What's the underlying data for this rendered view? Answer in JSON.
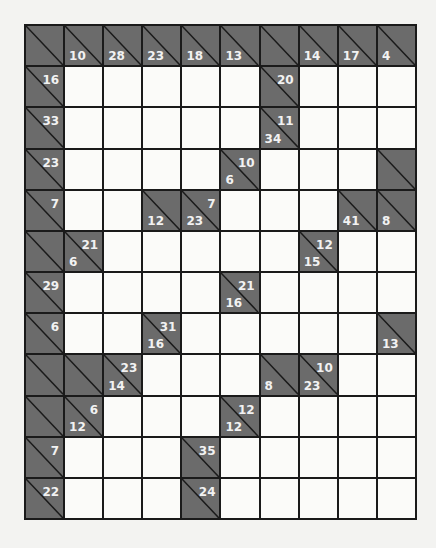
{
  "puzzle": {
    "type": "kakuro",
    "rows": 12,
    "cols": 10,
    "colors": {
      "clue_cell": "#6b6b6b",
      "white_cell": "#fbfbf9",
      "grid_line": "#1a1a1a",
      "clue_text": "#f2f2f2",
      "page_bg": "#f3f3f1"
    },
    "grid": [
      [
        {
          "t": "c"
        },
        {
          "t": "c",
          "d": "10"
        },
        {
          "t": "c",
          "d": "28"
        },
        {
          "t": "c",
          "d": "23"
        },
        {
          "t": "c",
          "d": "18"
        },
        {
          "t": "c",
          "d": "13"
        },
        {
          "t": "c"
        },
        {
          "t": "c",
          "d": "14"
        },
        {
          "t": "c",
          "d": "17"
        },
        {
          "t": "c",
          "d": "4"
        }
      ],
      [
        {
          "t": "c",
          "a": "16"
        },
        {
          "t": "w"
        },
        {
          "t": "w"
        },
        {
          "t": "w"
        },
        {
          "t": "w"
        },
        {
          "t": "w"
        },
        {
          "t": "c",
          "a": "20"
        },
        {
          "t": "w"
        },
        {
          "t": "w"
        },
        {
          "t": "w"
        }
      ],
      [
        {
          "t": "c",
          "a": "33"
        },
        {
          "t": "w"
        },
        {
          "t": "w"
        },
        {
          "t": "w"
        },
        {
          "t": "w"
        },
        {
          "t": "w"
        },
        {
          "t": "c",
          "a": "11",
          "d": "34"
        },
        {
          "t": "w"
        },
        {
          "t": "w"
        },
        {
          "t": "w"
        }
      ],
      [
        {
          "t": "c",
          "a": "23"
        },
        {
          "t": "w"
        },
        {
          "t": "w"
        },
        {
          "t": "w"
        },
        {
          "t": "w"
        },
        {
          "t": "c",
          "a": "10",
          "d": "6"
        },
        {
          "t": "w"
        },
        {
          "t": "w"
        },
        {
          "t": "w"
        },
        {
          "t": "c"
        }
      ],
      [
        {
          "t": "c",
          "a": "7"
        },
        {
          "t": "w"
        },
        {
          "t": "w"
        },
        {
          "t": "c",
          "d": "12"
        },
        {
          "t": "c",
          "a": "7",
          "d": "23"
        },
        {
          "t": "w"
        },
        {
          "t": "w"
        },
        {
          "t": "w"
        },
        {
          "t": "c",
          "d": "41"
        },
        {
          "t": "c",
          "d": "8"
        }
      ],
      [
        {
          "t": "c"
        },
        {
          "t": "c",
          "a": "21",
          "d": "6"
        },
        {
          "t": "w"
        },
        {
          "t": "w"
        },
        {
          "t": "w"
        },
        {
          "t": "w"
        },
        {
          "t": "w"
        },
        {
          "t": "c",
          "a": "12",
          "d": "15"
        },
        {
          "t": "w"
        },
        {
          "t": "w"
        }
      ],
      [
        {
          "t": "c",
          "a": "29"
        },
        {
          "t": "w"
        },
        {
          "t": "w"
        },
        {
          "t": "w"
        },
        {
          "t": "w"
        },
        {
          "t": "c",
          "a": "21",
          "d": "16"
        },
        {
          "t": "w"
        },
        {
          "t": "w"
        },
        {
          "t": "w"
        },
        {
          "t": "w"
        }
      ],
      [
        {
          "t": "c",
          "a": "6"
        },
        {
          "t": "w"
        },
        {
          "t": "w"
        },
        {
          "t": "c",
          "a": "31",
          "d": "16"
        },
        {
          "t": "w"
        },
        {
          "t": "w"
        },
        {
          "t": "w"
        },
        {
          "t": "w"
        },
        {
          "t": "w"
        },
        {
          "t": "c",
          "d": "13"
        }
      ],
      [
        {
          "t": "c"
        },
        {
          "t": "c"
        },
        {
          "t": "c",
          "a": "23",
          "d": "14"
        },
        {
          "t": "w"
        },
        {
          "t": "w"
        },
        {
          "t": "w"
        },
        {
          "t": "c",
          "d": "8"
        },
        {
          "t": "c",
          "a": "10",
          "d": "23"
        },
        {
          "t": "w"
        },
        {
          "t": "w"
        }
      ],
      [
        {
          "t": "c"
        },
        {
          "t": "c",
          "a": "6",
          "d": "12"
        },
        {
          "t": "w"
        },
        {
          "t": "w"
        },
        {
          "t": "w"
        },
        {
          "t": "c",
          "a": "12",
          "d": "12"
        },
        {
          "t": "w"
        },
        {
          "t": "w"
        },
        {
          "t": "w"
        },
        {
          "t": "w"
        }
      ],
      [
        {
          "t": "c",
          "a": "7"
        },
        {
          "t": "w"
        },
        {
          "t": "w"
        },
        {
          "t": "w"
        },
        {
          "t": "c",
          "a": "35"
        },
        {
          "t": "w"
        },
        {
          "t": "w"
        },
        {
          "t": "w"
        },
        {
          "t": "w"
        },
        {
          "t": "w"
        }
      ],
      [
        {
          "t": "c",
          "a": "22"
        },
        {
          "t": "w"
        },
        {
          "t": "w"
        },
        {
          "t": "w"
        },
        {
          "t": "c",
          "a": "24"
        },
        {
          "t": "w"
        },
        {
          "t": "w"
        },
        {
          "t": "w"
        },
        {
          "t": "w"
        },
        {
          "t": "w"
        }
      ]
    ]
  }
}
